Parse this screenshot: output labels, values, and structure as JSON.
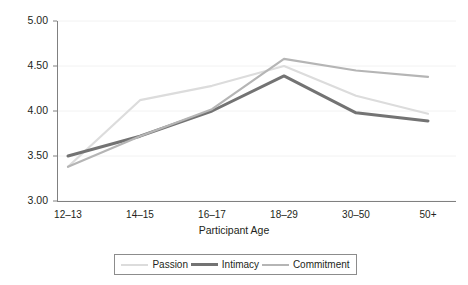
{
  "chart_data": {
    "type": "line",
    "title": "",
    "xlabel": "Participant Age",
    "ylabel": "",
    "categories": [
      "12–13",
      "14–15",
      "16–17",
      "18–29",
      "30–50",
      "50+"
    ],
    "ylim": [
      3.0,
      5.0
    ],
    "yticks": [
      "3.00",
      "3.50",
      "4.00",
      "4.50",
      "5.00"
    ],
    "ytick_values": [
      3.0,
      3.5,
      4.0,
      4.5,
      5.0
    ],
    "grid": true,
    "legend_position": "bottom",
    "series": [
      {
        "name": "Passion",
        "color": "#dcdcdc",
        "width": 2.2,
        "values": [
          3.38,
          4.12,
          4.28,
          4.5,
          4.17,
          3.97
        ]
      },
      {
        "name": "Intimacy",
        "color": "#737373",
        "width": 3.0,
        "values": [
          3.5,
          3.72,
          4.0,
          4.39,
          3.98,
          3.89
        ]
      },
      {
        "name": "Commitment",
        "color": "#b5b5b5",
        "width": 2.2,
        "values": [
          3.38,
          3.72,
          4.02,
          4.58,
          4.45,
          4.38
        ]
      }
    ]
  },
  "axis": {
    "line_color": "#808080",
    "grid_color": "#f2f2f2",
    "tick_color": "#808080"
  }
}
